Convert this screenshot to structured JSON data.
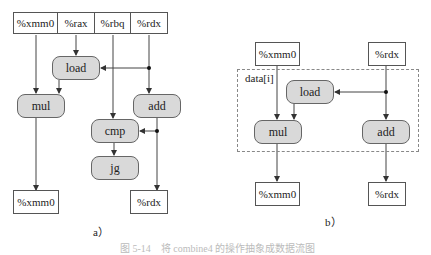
{
  "diagram_a": {
    "label": "a）",
    "top_registers": [
      "%xmm0",
      "%rax",
      "%rbq",
      "%rdx"
    ],
    "operations": {
      "load": "load",
      "mul": "mul",
      "add": "add",
      "cmp": "cmp",
      "jg": "jg"
    },
    "bottom_registers": [
      "%xmm0",
      "%rdx"
    ]
  },
  "diagram_b": {
    "label": "b）",
    "top_registers": [
      "%xmm0",
      "%rdx"
    ],
    "loop_box_label": "data[i]",
    "operations": {
      "load": "load",
      "mul": "mul",
      "add": "add"
    },
    "bottom_registers": [
      "%xmm0",
      "%rdx"
    ]
  },
  "caption": "图 5-14　将 combine4 的操作抽象成数据流图"
}
